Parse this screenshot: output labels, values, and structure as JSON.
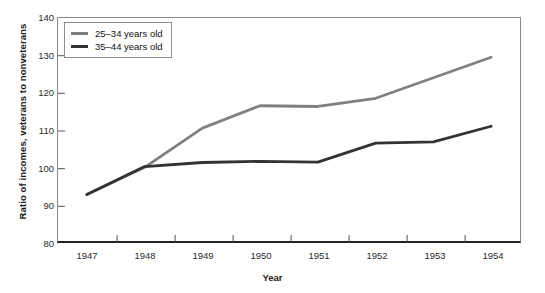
{
  "chart_data": {
    "type": "line",
    "title": "",
    "xlabel": "Year",
    "ylabel": "Ratio of incomes, veterans to nonveterans",
    "categories": [
      "1947",
      "1948",
      "1949",
      "1950",
      "1951",
      "1952",
      "1953",
      "1954"
    ],
    "x": [
      1947,
      1948,
      1949,
      1950,
      1951,
      1952,
      1953,
      1954
    ],
    "xlim": [
      1946.5,
      1954.5
    ],
    "ylim": [
      80,
      140
    ],
    "yticks": [
      80,
      90,
      100,
      110,
      120,
      130,
      140
    ],
    "grid": false,
    "legend_position": "top-left",
    "series": [
      {
        "name": "25–34 years old",
        "color": "#808080",
        "values": [
          92.7,
          100.0,
          110.5,
          116.5,
          116.3,
          118.5,
          124.0,
          129.5
        ]
      },
      {
        "name": "35–44 years old",
        "color": "#333333",
        "values": [
          92.7,
          100.2,
          101.3,
          101.6,
          101.4,
          106.5,
          106.8,
          111.0
        ]
      }
    ]
  },
  "legend": {
    "items": [
      {
        "label": "25–34 years old",
        "color": "#808080"
      },
      {
        "label": "35–44 years old",
        "color": "#333333"
      }
    ]
  },
  "axes": {
    "y_title": "Ratio of incomes, veterans to nonveterans",
    "x_title": "Year",
    "y_tick_labels": [
      "140",
      "130",
      "120",
      "110",
      "100",
      "90",
      "80"
    ],
    "x_tick_labels": [
      "1947",
      "1948",
      "1949",
      "1950",
      "1951",
      "1952",
      "1953",
      "1954"
    ]
  },
  "colors": {
    "series_a": "#808080",
    "series_b": "#333333",
    "axis": "#222222",
    "frame": "#8a8a8a",
    "text": "#1a1a1a",
    "background": "#ffffff"
  }
}
